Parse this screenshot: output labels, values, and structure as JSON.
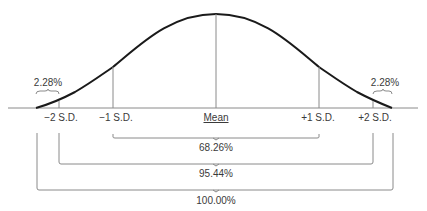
{
  "diagram": {
    "type": "normal-distribution",
    "axis_labels": [
      {
        "id": "minus2",
        "text": "−2 S.D.",
        "x": 59
      },
      {
        "id": "minus1",
        "text": "−1 S.D.",
        "x": 113
      },
      {
        "id": "mean",
        "text": "Mean",
        "x": 216
      },
      {
        "id": "plus1",
        "text": "+1 S.D.",
        "x": 319
      },
      {
        "id": "plus2",
        "text": "+2 S.D.",
        "x": 373
      }
    ],
    "tail_labels": {
      "left": "2.28%",
      "right": "2.28%"
    },
    "ranges": [
      {
        "label": "68.26%",
        "from": "−1 S.D.",
        "to": "+1 S.D."
      },
      {
        "label": "95.44%",
        "from": "−2 S.D.",
        "to": "+2 S.D."
      },
      {
        "label": "100.00%",
        "from": "left tail",
        "to": "right tail"
      }
    ],
    "colors": {
      "curve": "#1a1a1a",
      "lines": "#8a8a8a",
      "text": "#3a3a3a"
    }
  }
}
